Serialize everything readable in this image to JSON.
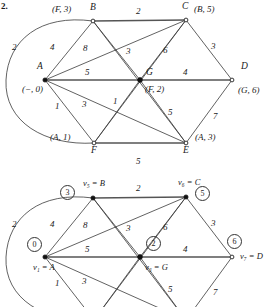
{
  "figure": {
    "number": "2."
  },
  "graphs": [
    {
      "id": "upper-graph",
      "name": "dijkstra-labeled-graph",
      "vertices": [
        {
          "id": "A",
          "name": "A",
          "tag": "(−, 0)",
          "x": 45,
          "y": 80,
          "style": "filled",
          "name_dx": -8,
          "name_dy": -15,
          "tag_dx": -22,
          "tag_dy": 6
        },
        {
          "id": "B",
          "name": "B",
          "tag": "(F, 3)",
          "x": 93,
          "y": 21,
          "style": "open",
          "name_dx": -3,
          "name_dy": -16,
          "tag_dx": -40,
          "tag_dy": -14
        },
        {
          "id": "C",
          "name": "C",
          "tag": "(B, 5)",
          "x": 186,
          "y": 20,
          "style": "open",
          "name_dx": -4,
          "name_dy": -16,
          "tag_dx": 8,
          "tag_dy": -13
        },
        {
          "id": "D",
          "name": "D",
          "tag": "(G, 6)",
          "x": 232,
          "y": 80,
          "style": "open",
          "name_dx": 9,
          "name_dy": -16,
          "tag_dx": 6,
          "tag_dy": 7
        },
        {
          "id": "E",
          "name": "E",
          "tag": "(A, 3)",
          "x": 186,
          "y": 143,
          "style": "open",
          "name_dx": -3,
          "name_dy": 4,
          "tag_dx": 9,
          "tag_dy": -9
        },
        {
          "id": "F",
          "name": "F",
          "tag": "(A, 1)",
          "x": 94,
          "y": 143,
          "style": "open",
          "name_dx": -3,
          "name_dy": 4,
          "tag_dx": -44,
          "tag_dy": -9
        },
        {
          "id": "G",
          "name": "G",
          "tag": "(F, 2)",
          "x": 140,
          "y": 80,
          "style": "filled",
          "name_dx": 6,
          "name_dy": -11,
          "tag_dx": 5,
          "tag_dy": 4
        }
      ],
      "edges": [
        {
          "from": "A",
          "to": "B",
          "weight": "4",
          "wx": 63,
          "wy": 47,
          "curve": 0
        },
        {
          "from": "A",
          "to": "C",
          "weight": "8",
          "wx": 100,
          "wy": 46,
          "curve": 0
        },
        {
          "from": "A",
          "to": "G",
          "weight": "5",
          "wx": 91,
          "wy": 71,
          "curve": 0
        },
        {
          "from": "A",
          "to": "E",
          "weight": "3",
          "wx": 77,
          "wy": 106,
          "curve": 0
        },
        {
          "from": "A",
          "to": "F",
          "weight": "1",
          "wx": 58,
          "wy": 108,
          "curve": 0
        },
        {
          "from": "A",
          "to": "B",
          "weight": "2",
          "wx": 17,
          "wy": 47,
          "curve": -60,
          "alt": true
        },
        {
          "from": "B",
          "to": "C",
          "weight": "2",
          "wx": 137,
          "wy": 11,
          "curve": 0
        },
        {
          "from": "B",
          "to": "G",
          "weight": "3",
          "wx": 127,
          "wy": 50,
          "curve": 0
        },
        {
          "from": "B",
          "to": "E",
          "weight": "",
          "wx": 0,
          "wy": 0,
          "curve": 0
        },
        {
          "from": "C",
          "to": "G",
          "weight": "6",
          "wx": 163,
          "wy": 48,
          "curve": 0
        },
        {
          "from": "C",
          "to": "D",
          "weight": "3",
          "wx": 215,
          "wy": 46,
          "curve": 0
        },
        {
          "from": "C",
          "to": "F",
          "weight": "",
          "wx": 0,
          "wy": 0,
          "curve": 0
        },
        {
          "from": "G",
          "to": "D",
          "weight": "4",
          "wx": 184,
          "wy": 71,
          "curve": 0
        },
        {
          "from": "G",
          "to": "F",
          "weight": "1",
          "wx": 113,
          "wy": 104,
          "curve": 0
        },
        {
          "from": "G",
          "to": "E",
          "weight": "5",
          "wx": 164,
          "wy": 112,
          "curve": 0
        },
        {
          "from": "D",
          "to": "E",
          "weight": "7",
          "wx": 215,
          "wy": 114,
          "curve": 0
        },
        {
          "from": "F",
          "to": "E",
          "weight": "5",
          "wx": 137,
          "wy": 155,
          "curve": 0
        }
      ],
      "curved_edge": {
        "weight": "2",
        "label_x": 17,
        "label_y": 46
      }
    },
    {
      "id": "lower-graph",
      "name": "dijkstra-indexed-graph",
      "vertices": [
        {
          "id": "A",
          "name": "v₁ = A",
          "dist": "0",
          "x": 45,
          "y": 257,
          "style": "filled",
          "name_dx": -8,
          "name_dy": 7,
          "dist_dx": -16,
          "dist_dy": -18
        },
        {
          "id": "B",
          "name": "v₅ = B",
          "dist": "3",
          "x": 93,
          "y": 198,
          "style": "filled",
          "name_dx": -3,
          "name_dy": -16,
          "dist_dx": -31,
          "dist_dy": -12
        },
        {
          "id": "C",
          "name": "v₆ = C",
          "dist": "5",
          "x": 186,
          "y": 197,
          "style": "filled",
          "name_dx": -3,
          "name_dy": -16,
          "dist_dx": 10,
          "dist_dy": -8
        },
        {
          "id": "D",
          "name": "v₇ = D",
          "dist": "6",
          "x": 232,
          "y": 257,
          "style": "open",
          "name_dx": 8,
          "name_dy": -3,
          "dist_dx": 2,
          "dist_dy": -21
        },
        {
          "id": "G",
          "name": "v₃ = G",
          "dist": "2",
          "x": 140,
          "y": 257,
          "style": "filled",
          "name_dx": 5,
          "name_dy": 6,
          "dist_dx": 8,
          "dist_dy": -19
        }
      ],
      "edges": [
        {
          "from": "A",
          "to": "B",
          "weight": "4",
          "wx": 63,
          "wy": 224
        },
        {
          "from": "A",
          "to": "C",
          "weight": "8",
          "wx": 100,
          "wy": 223
        },
        {
          "from": "A",
          "to": "G",
          "weight": "5",
          "wx": 91,
          "wy": 248
        },
        {
          "from": "A",
          "to": "E",
          "weight": "3",
          "wx": 77,
          "wy": 283
        },
        {
          "from": "A",
          "to": "F",
          "weight": "1",
          "wx": 58,
          "wy": 285
        },
        {
          "from": "B",
          "to": "C",
          "weight": "2",
          "wx": 137,
          "wy": 188
        },
        {
          "from": "B",
          "to": "G",
          "weight": "3",
          "wx": 127,
          "wy": 227
        },
        {
          "from": "C",
          "to": "G",
          "weight": "6",
          "wx": 163,
          "wy": 225
        },
        {
          "from": "C",
          "to": "D",
          "weight": "3",
          "wx": 215,
          "wy": 223
        },
        {
          "from": "G",
          "to": "D",
          "weight": "4",
          "wx": 184,
          "wy": 248
        },
        {
          "from": "G",
          "to": "E",
          "weight": "5",
          "wx": 164,
          "wy": 289
        },
        {
          "from": "D",
          "to": "E",
          "weight": "7",
          "wx": 215,
          "wy": 291
        },
        {
          "from": "A",
          "to": "B",
          "weight": "2",
          "wx": 17,
          "wy": 224,
          "alt": true
        }
      ]
    }
  ]
}
